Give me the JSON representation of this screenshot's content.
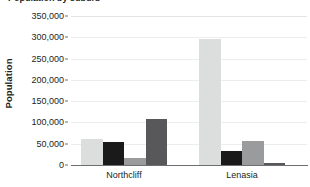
{
  "title_fragment": "Population by suburb",
  "chart_data": {
    "type": "bar",
    "title": "Population by suburb",
    "xlabel": "",
    "ylabel": "Population",
    "categories": [
      "Northcliff",
      "Lenasia"
    ],
    "ylim": [
      0,
      350000
    ],
    "ytick_values": [
      0,
      50000,
      100000,
      150000,
      200000,
      250000,
      300000,
      350000
    ],
    "ytick_labels": [
      "0",
      "50,000",
      "100,000",
      "150,000",
      "200,000",
      "250,000",
      "300,000",
      "350,000"
    ],
    "grid": true,
    "legend": "none",
    "series": [
      {
        "name": "series-1",
        "color": "#dcdddd",
        "values": [
          62000,
          295000
        ]
      },
      {
        "name": "series-2",
        "color": "#1a1a1a",
        "values": [
          54000,
          33000
        ]
      },
      {
        "name": "series-3",
        "color": "#9a9b9d",
        "values": [
          17000,
          57000
        ]
      },
      {
        "name": "series-4",
        "color": "#58585a",
        "values": [
          108000,
          4000
        ]
      }
    ]
  },
  "colors": {
    "axis": "#6d6e71",
    "grid": "#eceded",
    "text": "#231f20",
    "background": "#ffffff"
  }
}
